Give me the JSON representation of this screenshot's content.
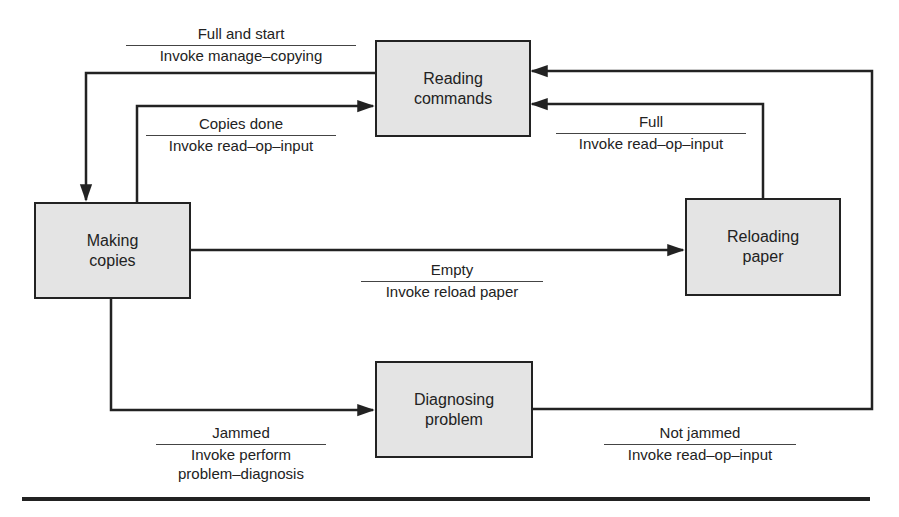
{
  "diagram": {
    "type": "state-transition",
    "states": [
      {
        "id": "reading",
        "line1": "Reading",
        "line2": "commands"
      },
      {
        "id": "making",
        "line1": "Making",
        "line2": "copies"
      },
      {
        "id": "reloading",
        "line1": "Reloading",
        "line2": "paper"
      },
      {
        "id": "diagnosing",
        "line1": "Diagnosing",
        "line2": "problem"
      }
    ],
    "transitions": [
      {
        "from": "reading",
        "to": "making",
        "event": "Full and start",
        "action": "Invoke manage–copying"
      },
      {
        "from": "making",
        "to": "reading",
        "event": "Copies done",
        "action": "Invoke read–op–input"
      },
      {
        "from": "reloading",
        "to": "reading",
        "event": "Full",
        "action": "Invoke read–op–input"
      },
      {
        "from": "making",
        "to": "reloading",
        "event": "Empty",
        "action": "Invoke reload paper"
      },
      {
        "from": "making",
        "to": "diagnosing",
        "event": "Jammed",
        "action": "Invoke perform",
        "action2": "problem–diagnosis"
      },
      {
        "from": "diagnosing",
        "to": "reading",
        "event": "Not jammed",
        "action": "Invoke read–op–input"
      }
    ]
  }
}
